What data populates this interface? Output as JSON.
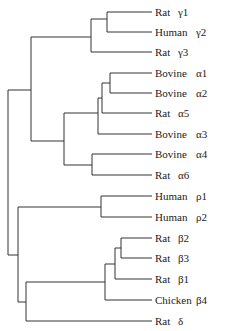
{
  "diagram": {
    "type": "phylogenetic-tree",
    "line_color": "#333333",
    "leaves": [
      {
        "species": "Rat",
        "subunit": "γ1",
        "y": 12
      },
      {
        "species": "Human",
        "subunit": "γ2",
        "y": 32
      },
      {
        "species": "Rat",
        "subunit": "γ3",
        "y": 52
      },
      {
        "species": "Bovine",
        "subunit": "α1",
        "y": 73
      },
      {
        "species": "Bovine",
        "subunit": "α2",
        "y": 93
      },
      {
        "species": "Rat",
        "subunit": "α5",
        "y": 113
      },
      {
        "species": "Bovine",
        "subunit": "α3",
        "y": 134
      },
      {
        "species": "Bovine",
        "subunit": "α4",
        "y": 154
      },
      {
        "species": "Rat",
        "subunit": "α6",
        "y": 175
      },
      {
        "species": "Human",
        "subunit": "ρ1",
        "y": 196
      },
      {
        "species": "Human",
        "subunit": "ρ2",
        "y": 217
      },
      {
        "species": "Rat",
        "subunit": "β2",
        "y": 238
      },
      {
        "species": "Rat",
        "subunit": "β3",
        "y": 258
      },
      {
        "species": "Rat",
        "subunit": "β1",
        "y": 279
      },
      {
        "species": "Chicken",
        "subunit": "β4",
        "y": 300
      },
      {
        "species": "Rat",
        "subunit": "δ",
        "y": 321
      }
    ]
  }
}
